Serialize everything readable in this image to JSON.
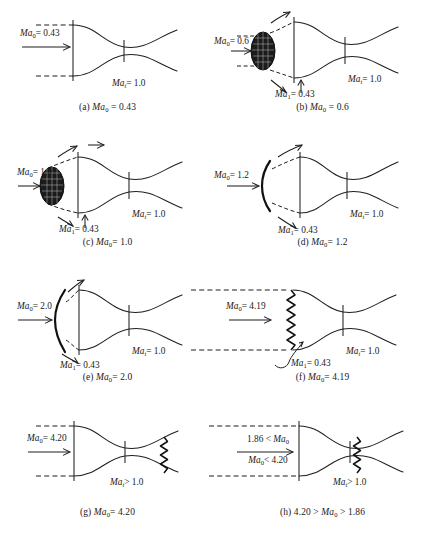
{
  "figure": {
    "throat_label_sonic": "Ma",
    "colors": {
      "ink": "#1f1f1f",
      "shock": "#111111",
      "background": "#ffffff"
    }
  },
  "panels": [
    {
      "id": "a",
      "caption_prefix": "(a)",
      "caption_symbol": "Ma",
      "caption_sub": "0",
      "caption_value": "= 0.43",
      "freestream": {
        "symbol": "Ma",
        "sub": "0",
        "value": "= 0.43"
      },
      "throat": {
        "symbol": "Ma",
        "sub": "t",
        "value": "= 1.0"
      },
      "inlet_station": null,
      "shock_type": "none",
      "notes": "Subsonic freestream, streamtube contracts into inlet, throat choked"
    },
    {
      "id": "b",
      "caption_prefix": "(b)",
      "caption_symbol": "Ma",
      "caption_sub": "0",
      "caption_value": "= 0.6",
      "freestream": {
        "symbol": "Ma",
        "sub": "0",
        "value": "= 0.6"
      },
      "throat": {
        "symbol": "Ma",
        "sub": "t",
        "value": "= 1.0"
      },
      "inlet_station": {
        "symbol": "Ma",
        "sub": "1",
        "value": "= 0.43"
      },
      "shock_type": "blob",
      "notes": "Spillage blob ahead of cowl, flow turned around lip"
    },
    {
      "id": "c",
      "caption_prefix": "(c)",
      "caption_symbol": "Ma",
      "caption_sub": "0",
      "caption_value": "= 1.0",
      "freestream": {
        "symbol": "Ma",
        "sub": "0",
        "value": "= 1.0"
      },
      "throat": {
        "symbol": "Ma",
        "sub": "t",
        "value": "= 1.0"
      },
      "inlet_station": {
        "symbol": "Ma",
        "sub": "1",
        "value": "= 0.43"
      },
      "shock_type": "blob",
      "notes": "Sonic freestream with detached spillage region"
    },
    {
      "id": "d",
      "caption_prefix": "(d)",
      "caption_symbol": "Ma",
      "caption_sub": "0",
      "caption_value": "= 1.2",
      "freestream": {
        "symbol": "Ma",
        "sub": "0",
        "value": "= 1.2"
      },
      "throat": {
        "symbol": "Ma",
        "sub": "t",
        "value": "= 1.0"
      },
      "inlet_station": {
        "symbol": "Ma",
        "sub": "1",
        "value": "= 0.43"
      },
      "shock_type": "bow",
      "notes": "Detached curved bow shock ahead of cowl lip"
    },
    {
      "id": "e",
      "caption_prefix": "(e)",
      "caption_symbol": "Ma",
      "caption_sub": "0",
      "caption_value": "= 2.0",
      "freestream": {
        "symbol": "Ma",
        "sub": "0",
        "value": "= 2.0"
      },
      "throat": {
        "symbol": "Ma",
        "sub": "t",
        "value": "= 1.0"
      },
      "inlet_station": {
        "symbol": "Ma",
        "sub": "1",
        "value": "= 0.43"
      },
      "shock_type": "bow",
      "notes": "Bow shock closer to lip, more spillage turning"
    },
    {
      "id": "f",
      "caption_prefix": "(f)",
      "caption_symbol": "Ma",
      "caption_sub": "0",
      "caption_value": "= 4.19",
      "freestream": {
        "symbol": "Ma",
        "sub": "0",
        "value": "= 4.19"
      },
      "throat": {
        "symbol": "Ma",
        "sub": "t",
        "value": "= 1.0"
      },
      "inlet_station": {
        "symbol": "Ma",
        "sub": "1",
        "value": "= 0.43"
      },
      "shock_type": "normal-at-lip",
      "notes": "Normal shock attached at inlet plane, shock swallowed at 4.20"
    },
    {
      "id": "g",
      "caption_prefix": "(g)",
      "caption_symbol": "Ma",
      "caption_sub": "0",
      "caption_value": "= 4.20",
      "freestream": {
        "symbol": "Ma",
        "sub": "0",
        "value": "= 4.20"
      },
      "throat": {
        "symbol": "Ma",
        "sub": "t",
        "value": "> 1.0"
      },
      "inlet_station": null,
      "shock_type": "swallowed-downstream",
      "notes": "Shock swallowed, supersonic throat, shock in divergent section"
    },
    {
      "id": "h",
      "caption_prefix": "(h)",
      "caption_text": "4.20 >",
      "caption_symbol": "Ma",
      "caption_sub": "0",
      "caption_value": "> 1.86",
      "freestream_line1": {
        "prefix": "1.86 <",
        "symbol": "Ma",
        "sub": "0"
      },
      "freestream_line2": {
        "symbol": "Ma",
        "sub": "0",
        "value": "< 4.20"
      },
      "throat": {
        "symbol": "Ma",
        "sub": "t",
        "value": "> 1.0"
      },
      "inlet_station": null,
      "shock_type": "swallowed-at-throat",
      "notes": "Supercritical operation; shock sits just downstream of throat"
    }
  ]
}
